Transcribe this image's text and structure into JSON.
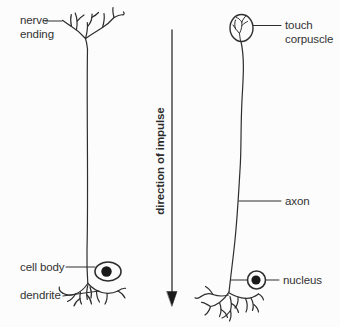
{
  "left_neuron": {
    "labels": {
      "nerve_ending_lines": [
        "nerve",
        "ending"
      ],
      "cell_body": "cell body",
      "dendrite": "dendrite"
    }
  },
  "right_neuron": {
    "labels": {
      "touch_corpuscle_lines": [
        "touch",
        "corpuscle"
      ],
      "axon": "axon",
      "nucleus": "nucleus"
    }
  },
  "impulse_arrow": {
    "label": "direction of impulse",
    "direction": "down"
  },
  "colors": {
    "background": "#fcfcfc",
    "line": "#2e2e2e",
    "text": "#333333",
    "solid_fill": "#1a1a1a"
  }
}
